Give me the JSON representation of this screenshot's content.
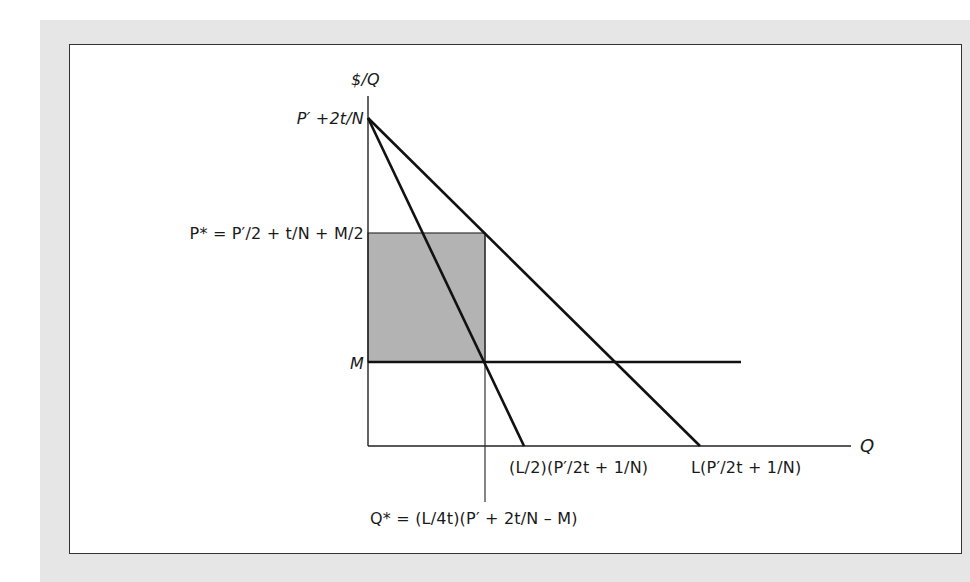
{
  "figure": {
    "background_panel_color": "#e6e6e6",
    "frame_color": "#ffffff",
    "shade_color": "#b3b3b3",
    "line_color": "#111111"
  },
  "axes": {
    "y_label": "$/Q",
    "x_label": "Q"
  },
  "labels": {
    "y_intercept": "P′ +2t/N",
    "p_star": "P* = P′/2 + t/N + M/2",
    "m": "M",
    "x_intercept_mr": "(L/2)(P′/2t + 1/N)",
    "x_intercept_demand": "L(P′/2t + 1/N)",
    "q_star": "Q* = (L/4t)(P′ + 2t/N – M)"
  },
  "curves": [
    {
      "name": "demand",
      "from": "P′ +2t/N",
      "to": "L(P′/2t + 1/N)"
    },
    {
      "name": "marginal-revenue",
      "from": "P′ +2t/N",
      "to": "(L/2)(P′/2t + 1/N)"
    },
    {
      "name": "marginal-cost",
      "level": "M",
      "type": "horizontal"
    }
  ],
  "shaded_region": {
    "description": "profit rectangle",
    "x_range": [
      "0",
      "Q*"
    ],
    "y_range": [
      "M",
      "P*"
    ]
  }
}
